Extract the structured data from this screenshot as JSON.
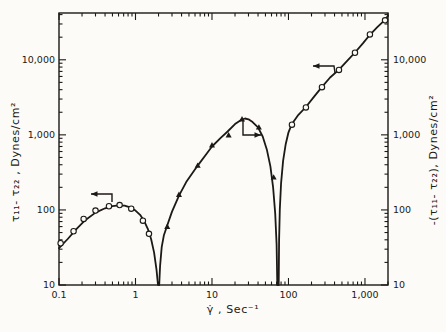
{
  "figure": {
    "background": "#fcfbf7",
    "ink": "#1c1916",
    "caption": ""
  },
  "chart_data": {
    "type": "line",
    "scale": "log-log",
    "grid": false,
    "legend": "none",
    "plot_px": {
      "left": 59,
      "right": 388,
      "top": 13,
      "bottom": 285
    },
    "x_axis": {
      "label": "γ̇ , Sec⁻¹",
      "min": 0.1,
      "max": 2000,
      "ticks": [
        {
          "v": 0.1,
          "label": "0.1"
        },
        {
          "v": 1,
          "label": "1"
        },
        {
          "v": 10,
          "label": "10"
        },
        {
          "v": 100,
          "label": "100"
        },
        {
          "v": 1000,
          "label": "1,000"
        }
      ]
    },
    "y_axis_left": {
      "label": "τ₁₁- τ₂₂ , Dynes/cm²",
      "min": 10,
      "max": 42000,
      "ticks": [
        {
          "v": 10,
          "label": "10"
        },
        {
          "v": 100,
          "label": "100"
        },
        {
          "v": 1000,
          "label": "1,000"
        },
        {
          "v": 10000,
          "label": "10,000"
        }
      ]
    },
    "y_axis_right": {
      "label": "-(τ₁₁- τ₂₂), Dynes/cm²",
      "min": 10,
      "max": 42000,
      "ticks": [
        {
          "v": 10,
          "label": "10"
        },
        {
          "v": 100,
          "label": "100"
        },
        {
          "v": 1000,
          "label": "1,000"
        },
        {
          "v": 10000,
          "label": "10,000"
        }
      ]
    },
    "cusps_x": [
      2,
      73
    ],
    "series": [
      {
        "name": "branch-1-circles-left-axis",
        "marker": "circle",
        "axis": "left",
        "points": [
          [
            0.105,
            36
          ],
          [
            0.155,
            52
          ],
          [
            0.21,
            76
          ],
          [
            0.3,
            98
          ],
          [
            0.45,
            112
          ],
          [
            0.62,
            116
          ],
          [
            0.88,
            104
          ],
          [
            1.25,
            72
          ],
          [
            1.5,
            48
          ]
        ]
      },
      {
        "name": "branch-2-triangles-right-axis",
        "marker": "triangle",
        "axis": "right",
        "points": [
          [
            2.6,
            60
          ],
          [
            3.7,
            160
          ],
          [
            6.5,
            390
          ],
          [
            10,
            730
          ],
          [
            16.5,
            990
          ],
          [
            24.7,
            1620
          ],
          [
            41,
            1260
          ],
          [
            64,
            272
          ]
        ]
      },
      {
        "name": "branch-3-circles-left-axis",
        "marker": "circle",
        "axis": "left",
        "points": [
          [
            111,
            1365
          ],
          [
            169,
            2320
          ],
          [
            274,
            4320
          ],
          [
            457,
            7330
          ],
          [
            740,
            12400
          ],
          [
            1160,
            21800
          ],
          [
            1830,
            33600
          ]
        ]
      }
    ],
    "curves": [
      {
        "name": "curve-branch-1",
        "points": [
          [
            0.1,
            31
          ],
          [
            0.13,
            41
          ],
          [
            0.17,
            56
          ],
          [
            0.22,
            73
          ],
          [
            0.3,
            92
          ],
          [
            0.4,
            105
          ],
          [
            0.5,
            112
          ],
          [
            0.6,
            115
          ],
          [
            0.72,
            114
          ],
          [
            0.85,
            108
          ],
          [
            1.0,
            98
          ],
          [
            1.15,
            86
          ],
          [
            1.3,
            71
          ],
          [
            1.45,
            56
          ],
          [
            1.6,
            41
          ],
          [
            1.75,
            27
          ],
          [
            1.88,
            16
          ],
          [
            1.97,
            10
          ]
        ]
      },
      {
        "name": "curve-branch-2",
        "points": [
          [
            2.04,
            10
          ],
          [
            2.1,
            18
          ],
          [
            2.2,
            32
          ],
          [
            2.35,
            46
          ],
          [
            2.6,
            62
          ],
          [
            3.0,
            95
          ],
          [
            3.7,
            155
          ],
          [
            4.6,
            235
          ],
          [
            6.5,
            390
          ],
          [
            8.5,
            560
          ],
          [
            10,
            700
          ],
          [
            13,
            910
          ],
          [
            16,
            1110
          ],
          [
            20,
            1390
          ],
          [
            24,
            1580
          ],
          [
            27,
            1650
          ],
          [
            30,
            1610
          ],
          [
            34,
            1480
          ],
          [
            40,
            1260
          ],
          [
            46,
            950
          ],
          [
            52,
            640
          ],
          [
            58,
            380
          ],
          [
            63,
            200
          ],
          [
            67,
            90
          ],
          [
            70,
            35
          ],
          [
            71.5,
            10
          ]
        ]
      },
      {
        "name": "curve-branch-3",
        "points": [
          [
            74.5,
            10
          ],
          [
            75.5,
            40
          ],
          [
            77,
            100
          ],
          [
            80,
            230
          ],
          [
            85,
            450
          ],
          [
            92,
            750
          ],
          [
            100,
            1080
          ],
          [
            111,
            1400
          ],
          [
            135,
            1850
          ],
          [
            169,
            2350
          ],
          [
            220,
            3300
          ],
          [
            274,
            4350
          ],
          [
            350,
            5800
          ],
          [
            457,
            7400
          ],
          [
            580,
            9600
          ],
          [
            740,
            12500
          ],
          [
            950,
            16800
          ],
          [
            1160,
            21500
          ],
          [
            1450,
            27200
          ],
          [
            1830,
            34000
          ],
          [
            2000,
            38500
          ]
        ]
      }
    ],
    "annotations": {
      "axis_arrows": [
        {
          "meaning": "branch-1-reads-left-axis",
          "direction": "left",
          "points_px": [
            [
              112,
              202
            ],
            [
              112,
              194
            ],
            [
              91,
              194
            ]
          ]
        },
        {
          "meaning": "branch-2-reads-right-axis",
          "direction": "right",
          "points_px": [
            [
              243,
              121
            ],
            [
              243,
              135
            ],
            [
              261,
              135
            ]
          ]
        },
        {
          "meaning": "branch-3-reads-left-axis",
          "direction": "left",
          "points_px": [
            [
              335,
              73
            ],
            [
              334,
              66
            ],
            [
              313,
              66
            ]
          ]
        }
      ]
    }
  }
}
